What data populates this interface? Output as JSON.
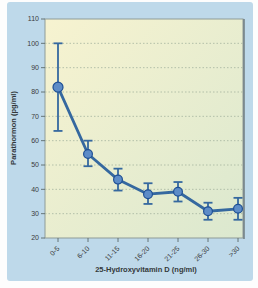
{
  "figure": {
    "background": "#fdfdfd",
    "panel_color": "#bed9ea"
  },
  "chart_data": {
    "type": "line",
    "title": "",
    "categories": [
      "0-5",
      "6-10",
      "11-15",
      "16-20",
      "21-25",
      "26-30",
      ">30"
    ],
    "series": [
      {
        "name": "Parathormon",
        "values": [
          82,
          54.5,
          44,
          38,
          39,
          31,
          32
        ],
        "error_low": [
          64,
          49.5,
          39.5,
          34,
          35,
          27.5,
          27.5
        ],
        "error_high": [
          100,
          60,
          48.5,
          42.5,
          43,
          34.5,
          36.5
        ]
      }
    ],
    "xlabel": "25-Hydroxyvitamin D (ng/ml)",
    "ylabel": "Parathormon (pg/ml)",
    "ylim": [
      20,
      110
    ],
    "ytick_step": 10,
    "grid": "horizontal-dotted",
    "legend": "none",
    "colors": {
      "line": "#35689f",
      "marker_fill": "#5d8cc7",
      "marker_stroke": "#1e4f95",
      "grid": "#a4b49e",
      "axis": "#5c6a6a",
      "plot_border": "#8e9b97",
      "plot_border_dark": "#6b7678",
      "plot_bg_start": "#f7f3d0",
      "plot_bg_end": "#dbe8cf",
      "text": "#3b3b3b"
    }
  }
}
